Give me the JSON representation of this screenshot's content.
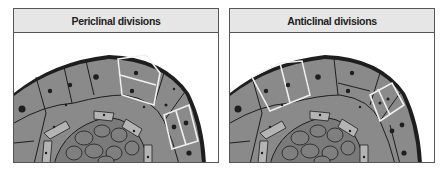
{
  "panels": [
    {
      "id": "left",
      "title": "Periclinal divisions",
      "highlighted_division": "periclinal"
    },
    {
      "id": "right",
      "title": "Anticlinal divisions",
      "highlighted_division": "anticlinal"
    }
  ],
  "colors": {
    "cell_fill": "#8a8a8a",
    "inner_cell_fill": "#7a7a7a",
    "pale_cell_fill": "#b4b4b4",
    "outline": "#1e1e1e",
    "highlight_wall": "#f0f0f0",
    "header_bg": "#e6e6e6"
  }
}
